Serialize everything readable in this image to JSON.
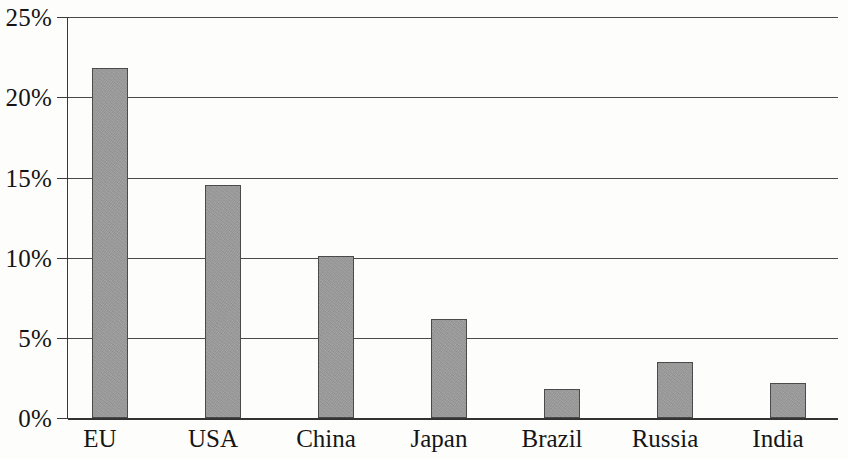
{
  "chart_data": {
    "type": "bar",
    "title": "",
    "subtitle": "",
    "xlabel": "",
    "ylabel": "",
    "categories": [
      "EU",
      "USA",
      "China",
      "Japan",
      "Brazil",
      "Russia",
      "India"
    ],
    "values": [
      21.8,
      14.5,
      10.1,
      6.2,
      1.8,
      3.5,
      2.2
    ],
    "value_labels": [
      "21.8%",
      "14.5%",
      "10.1%",
      "6.2%",
      "1.8%",
      "3.5%",
      "2.2%"
    ],
    "ylim": [
      0,
      25
    ],
    "ytick_values": [
      0,
      5,
      10,
      15,
      20,
      25
    ],
    "ytick_labels": [
      "0%",
      "5%",
      "10%",
      "15%",
      "20%",
      "25%"
    ],
    "grid": true,
    "grid_axis": "y",
    "legend": null,
    "legend_position": "none",
    "bar_fill_color": "#9d9d9d",
    "bar_border_color": "#4b4b4b",
    "gridline_color": "#4a4a4a",
    "axis_color": "#3a3a3a",
    "background_color": "#fdfdfc"
  }
}
